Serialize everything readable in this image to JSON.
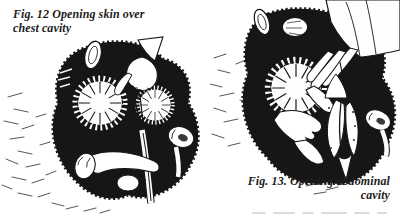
{
  "page": {
    "background_color": "#ffffff",
    "ink_color": "#161616"
  },
  "figures": {
    "fig12": {
      "caption_line1": "Fig. 12 Opening skin over",
      "caption_line2": "chest cavity"
    },
    "fig13": {
      "caption_line1": "Fig. 13. Opening abdominal",
      "caption_line2": "cavity"
    }
  }
}
